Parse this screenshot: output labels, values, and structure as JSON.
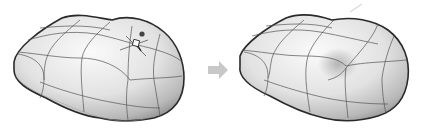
{
  "figure": {
    "panels": [
      {
        "id": "before",
        "label": "Before edit",
        "has_control_point": true
      },
      {
        "id": "after",
        "label": "After edit",
        "has_control_point": false
      }
    ],
    "arrow": {
      "direction": "right",
      "color": "#c8c8c8"
    },
    "colors": {
      "outline": "#2a2a2a",
      "isocurve": "#555555",
      "surface_light": "#f4f4f4",
      "surface_shadow": "#9a9a9a",
      "background": "#ffffff"
    }
  }
}
